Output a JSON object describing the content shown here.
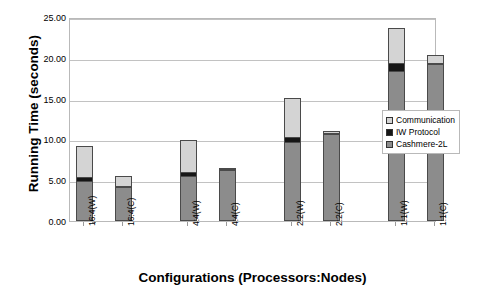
{
  "chart_data": {
    "type": "bar",
    "subtype": "stacked-bar",
    "title": "",
    "xlabel": "Configurations (Processors:Nodes)",
    "ylabel": "Running Time (seconds)",
    "ylim": [
      0,
      25
    ],
    "ytick_values": [
      0,
      5,
      10,
      15,
      20,
      25
    ],
    "ytick_labels": [
      "0.00",
      "5.00",
      "10.00",
      "15.00",
      "20.00",
      "25.00"
    ],
    "grid": true,
    "legend_position": "right",
    "categories": [
      "16:4(W)",
      "16:4(C)",
      "4:4(W)",
      "4:4(C)",
      "2:2(W)",
      "2:2(C)",
      "1:1(W)",
      "1:1(C)"
    ],
    "group_breaks": [
      2,
      4,
      6
    ],
    "series": [
      {
        "name": "Cashmere-2L",
        "color": "#8c8c8c",
        "values": [
          4.75,
          4.15,
          5.45,
          6.25,
          9.6,
          10.7,
          18.3,
          19.2
        ]
      },
      {
        "name": "IW Protocol",
        "color": "#161616",
        "values": [
          0.55,
          0.15,
          0.5,
          0.1,
          0.6,
          0.1,
          1.0,
          0.1
        ]
      },
      {
        "name": "Communication",
        "color": "#d4d4d4",
        "values": [
          3.9,
          1.2,
          3.95,
          0.15,
          4.9,
          0.2,
          4.3,
          1.1
        ]
      }
    ],
    "totals": [
      9.2,
      5.5,
      9.9,
      6.5,
      15.1,
      11.0,
      23.6,
      20.4
    ]
  },
  "legend": {
    "items": [
      {
        "label": "Communication",
        "swatch": "#d4d4d4"
      },
      {
        "label": "IW Protocol",
        "swatch": "#161616"
      },
      {
        "label": "Cashmere-2L",
        "swatch": "#8c8c8c"
      }
    ]
  },
  "colors": {
    "communication": "#d4d4d4",
    "iw_protocol": "#161616",
    "cashmere": "#8c8c8c",
    "gridline": "#c2c2c2",
    "plot_border": "#b9b9b9",
    "bar_outline": "#4a4a4a",
    "background": "#ffffff"
  }
}
